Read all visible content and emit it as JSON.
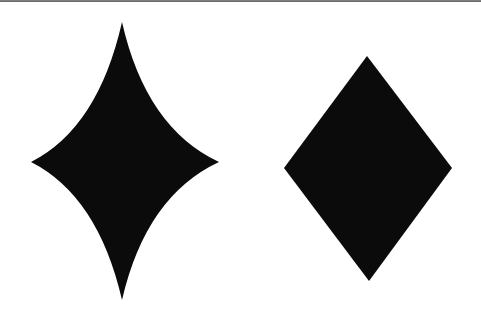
{
  "figure": {
    "background": "#ffffff",
    "top_rule_color": "#6f6f6f",
    "shapes": [
      {
        "name": "concave-four-point-star",
        "fill": "#0b0b0b",
        "top": [
          122,
          22
        ],
        "right": [
          219,
          162
        ],
        "bottom": [
          122,
          300
        ],
        "left": [
          31,
          162
        ]
      },
      {
        "name": "rhombus",
        "fill": "#0b0b0b",
        "top": [
          367,
          56
        ],
        "right": [
          452,
          168
        ],
        "bottom": [
          369,
          281
        ],
        "left": [
          284,
          168
        ]
      }
    ]
  }
}
